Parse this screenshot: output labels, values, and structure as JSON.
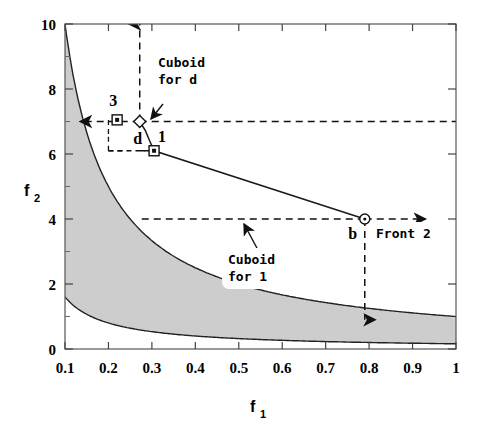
{
  "chart_data": {
    "type": "line",
    "title": "",
    "xlabel": "f_1",
    "ylabel": "f_2",
    "xlabel_base": "f",
    "xlabel_sub": "1",
    "ylabel_base": "f",
    "ylabel_sub": "2",
    "xlim": [
      0.1,
      1.0
    ],
    "ylim": [
      0,
      10
    ],
    "xticks": [
      0.1,
      0.2,
      0.3,
      0.4,
      0.5,
      0.6,
      0.7,
      0.8,
      0.9,
      1
    ],
    "xtick_labels": [
      "0.1",
      "0.2",
      "0.3",
      "0.4",
      "0.5",
      "0.6",
      "0.7",
      "0.8",
      "0.9",
      "1"
    ],
    "yticks": [
      0,
      2,
      4,
      6,
      8,
      10
    ],
    "ytick_labels": [
      "0",
      "2",
      "4",
      "6",
      "8",
      "10"
    ],
    "yminor": [
      1,
      3,
      5,
      7,
      9
    ],
    "grid": false,
    "legend_position": "none",
    "region": {
      "name": "feasible-region",
      "fill": "#cfcfcf",
      "upper_curve_k": 1.0,
      "lower_curve_k": 0.16,
      "description": "shaded area between f2=1.0/f1 (upper) and f2=0.16/f1 (lower)"
    },
    "series": [
      {
        "name": "Front 2",
        "style": "solid",
        "color": "#1a1a1a",
        "points": [
          {
            "x": 0.272,
            "y": 7.0
          },
          {
            "x": 0.285,
            "y": 6.72
          },
          {
            "x": 0.295,
            "y": 6.4
          },
          {
            "x": 0.305,
            "y": 6.1
          },
          {
            "x": 0.79,
            "y": 4.0
          }
        ]
      }
    ],
    "markers": [
      {
        "label": "3",
        "x": 0.22,
        "y": 7.05,
        "shape": "square",
        "label_dx": -4,
        "label_dy": -14
      },
      {
        "label": "d",
        "x": 0.272,
        "y": 7.0,
        "shape": "diamond",
        "label_dx": -2,
        "label_dy": 22
      },
      {
        "label": "1",
        "x": 0.305,
        "y": 6.1,
        "shape": "square",
        "label_dx": 8,
        "label_dy": -9
      },
      {
        "label": "b",
        "x": 0.79,
        "y": 4.0,
        "shape": "circle",
        "label_dx": -12,
        "label_dy": 20
      }
    ],
    "annotations": [
      {
        "text_line1": "Cuboid",
        "text_line2": "for d",
        "name": "cuboid-for-d-label"
      },
      {
        "text_line1": "Cuboid",
        "text_line2": "for 1",
        "name": "cuboid-for-1-label"
      },
      {
        "text_line1": "Front 2",
        "text_line2": "",
        "name": "front-2-label"
      }
    ],
    "cuboid_lines": [
      {
        "name": "cuboid-d-vertical",
        "x": 0.272,
        "from_y": 7.0,
        "to_y": 10.0,
        "arrow": "up"
      },
      {
        "name": "cuboid-d-horizontal",
        "x_from": 0.272,
        "x_to": 1.0,
        "y": 7.0,
        "arrow": "none"
      },
      {
        "name": "cuboid-1-vertical",
        "x": 0.79,
        "from_y": 4.0,
        "to_y": 0.9,
        "arrow": "down"
      },
      {
        "name": "cuboid-1-horizontal",
        "x_from": 0.79,
        "x_to": 0.272,
        "y": 4.0,
        "arrow": "none"
      },
      {
        "name": "front2-arrow-right",
        "x_from": 0.79,
        "x_to": 0.93,
        "y": 4.0,
        "arrow": "right"
      },
      {
        "name": "point3-arrow-left",
        "x_from": 0.272,
        "x_to": 0.135,
        "y": 7.0,
        "arrow": "left"
      }
    ]
  }
}
